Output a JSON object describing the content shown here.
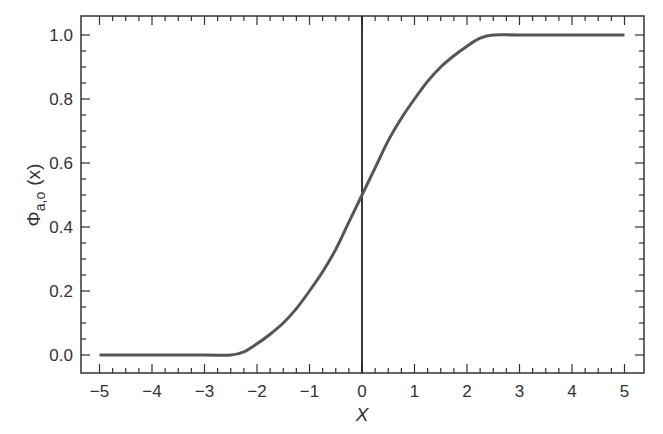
{
  "chart_data": {
    "type": "line",
    "title": "",
    "xlabel": "X",
    "ylabel": "Φ_{a,o} (x)",
    "ylabel_parts": {
      "symbol": "Φ",
      "subscript": "a,o",
      "arg": "(x)"
    },
    "xlim": [
      -5,
      5
    ],
    "ylim": [
      0,
      1.0
    ],
    "x_ticks": [
      -5,
      -4,
      -3,
      -2,
      -1,
      0,
      1,
      2,
      3,
      4,
      5
    ],
    "x_tick_labels": [
      "−5",
      "−4",
      "−3",
      "−2",
      "−1",
      "0",
      "1",
      "2",
      "3",
      "4",
      "5"
    ],
    "x_minor_step": 0.25,
    "y_ticks": [
      0.0,
      0.2,
      0.4,
      0.6,
      0.8,
      1.0
    ],
    "y_tick_labels": [
      "0.0",
      "0.2",
      "0.4",
      "0.6",
      "0.8",
      "1.0"
    ],
    "y_minor_step": 0.05,
    "grid": false,
    "legend": null,
    "annotations": [
      {
        "type": "vline",
        "x": 0,
        "color": "#222222"
      }
    ],
    "series": [
      {
        "name": "Φ_{a,o}(x)",
        "color": "#555555",
        "x": [
          -5,
          -4,
          -3,
          -2.5,
          -2.25,
          -2,
          -1.75,
          -1.5,
          -1.25,
          -1,
          -0.75,
          -0.5,
          -0.25,
          0,
          0.25,
          0.5,
          0.75,
          1,
          1.25,
          1.5,
          1.75,
          2,
          2.25,
          2.5,
          3,
          4,
          5
        ],
        "y": [
          0.0,
          0.0,
          0.0,
          0.0,
          0.01,
          0.035,
          0.065,
          0.1,
          0.145,
          0.2,
          0.26,
          0.33,
          0.415,
          0.5,
          0.585,
          0.67,
          0.74,
          0.8,
          0.855,
          0.9,
          0.935,
          0.965,
          0.99,
          1.0,
          1.0,
          1.0,
          1.0
        ]
      }
    ]
  }
}
